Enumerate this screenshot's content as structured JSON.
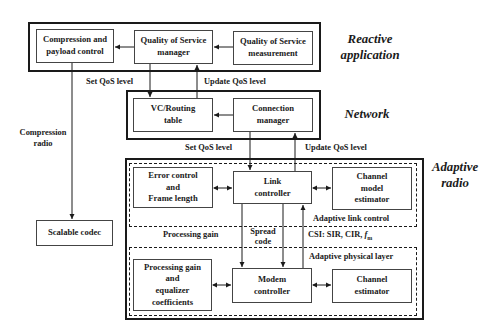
{
  "layers": {
    "reactive": [
      "Reactive",
      "application"
    ],
    "network": "Network",
    "adaptive": [
      "Adaptive",
      "radio"
    ]
  },
  "reactive_boxes": {
    "compression": [
      "Compression and",
      "payload control"
    ],
    "qos_manager": [
      "Quality of Service",
      "manager"
    ],
    "qos_measurement": [
      "Quality of Service",
      "measurement"
    ]
  },
  "network_boxes": {
    "vc_routing": [
      "VC/Routing",
      "table"
    ],
    "connection_manager": [
      "Connection",
      "manager"
    ]
  },
  "adaptive_boxes": {
    "error_control": [
      "Error control",
      "and",
      "Frame length"
    ],
    "link_controller": [
      "Link",
      "controller"
    ],
    "channel_model_estimator": [
      "Channel",
      "model",
      "estimator"
    ],
    "processing_gain_eq": [
      "Processing gain",
      "and",
      "equalizer",
      "coefficients"
    ],
    "modem_controller": [
      "Modem",
      "controller"
    ],
    "channel_estimator": [
      "Channel",
      "estimator"
    ]
  },
  "sublayers": {
    "link_control": "Adaptive link control",
    "physical_layer": "Adaptive physical layer"
  },
  "edge_labels": {
    "set_qos_1": "Set QoS level",
    "update_qos_1": "Update QoS level",
    "set_qos_2": "Set QoS level",
    "update_qos_2": "Update QoS level",
    "compression_radio": [
      "Compression",
      "radio"
    ],
    "processing_gain": "Processing gain",
    "spread_code": [
      "Spread",
      "code"
    ],
    "csi_prefix": "CSI: SIR, CIR, ",
    "csi_f": "f",
    "csi_sub": "m"
  },
  "codec": "Scalable codec"
}
